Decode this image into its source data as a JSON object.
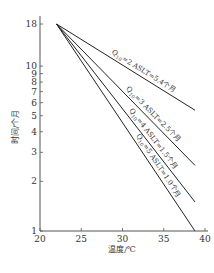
{
  "chart_data": {
    "type": "line",
    "title": "",
    "xlabel": "温度/℃",
    "ylabel": "时间/个月",
    "xscale": "linear",
    "yscale": "log",
    "xlim": [
      20,
      40
    ],
    "ylim": [
      1,
      18
    ],
    "xticks": [
      20,
      25,
      30,
      35,
      40
    ],
    "yticks": [
      1,
      2,
      3,
      4,
      5,
      6,
      7,
      8,
      9,
      10,
      18
    ],
    "grid": false,
    "legend": "none",
    "series": [
      {
        "name": "Q10=2 ASLT=5.4个月",
        "label_main": "Q",
        "label_sub": "10",
        "label_rest": "=2 ASLT=5.4个月",
        "x": [
          22,
          40
        ],
        "y": [
          18,
          5.4
        ]
      },
      {
        "name": "Q10=3 ASLT=2.5个月",
        "label_main": "Q",
        "label_sub": "10",
        "label_rest": "=3 ASLT=2.5个月",
        "x": [
          22,
          40
        ],
        "y": [
          18,
          2.5
        ]
      },
      {
        "name": "Q10=4 ASLT=1.5个月",
        "label_main": "Q",
        "label_sub": "10",
        "label_rest": "=4 ASLT=1.5个月",
        "x": [
          22,
          40
        ],
        "y": [
          18,
          1.5
        ]
      },
      {
        "name": "Q10=5 ASLT=1.0个月",
        "label_main": "Q",
        "label_sub": "10",
        "label_rest": "=5 ASLT=1.0个月",
        "x": [
          22,
          40
        ],
        "y": [
          18,
          1.0
        ]
      }
    ]
  }
}
